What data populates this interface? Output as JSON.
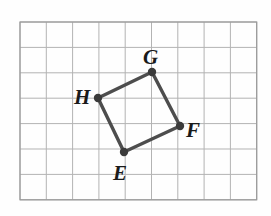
{
  "figure": {
    "shape_name": "EFGH",
    "background_color": "#fefefe",
    "grid": {
      "line_color": "#b3b3b3",
      "border_color": "#9a9a9a",
      "x0": 20,
      "y0": 22,
      "cell_width": 26.3,
      "cell_height": 25.4,
      "columns": 9,
      "rows": 7
    },
    "polygon": {
      "stroke_color": "#4d4d4d",
      "stroke_width": 3.4,
      "vertex_dot_color": "#3a3a3a",
      "vertex_dot_radius": 4.2,
      "points": "152,72 180,126 124,152 98,98",
      "vertices": [
        {
          "name": "E",
          "x": 124,
          "y": 152,
          "label_x": 113,
          "label_y": 180
        },
        {
          "name": "F",
          "x": 180,
          "y": 126,
          "label_x": 186,
          "label_y": 137
        },
        {
          "name": "G",
          "x": 152,
          "y": 72,
          "label_x": 143,
          "label_y": 64
        },
        {
          "name": "H",
          "x": 98,
          "y": 98,
          "label_x": 74,
          "label_y": 104
        }
      ]
    }
  }
}
